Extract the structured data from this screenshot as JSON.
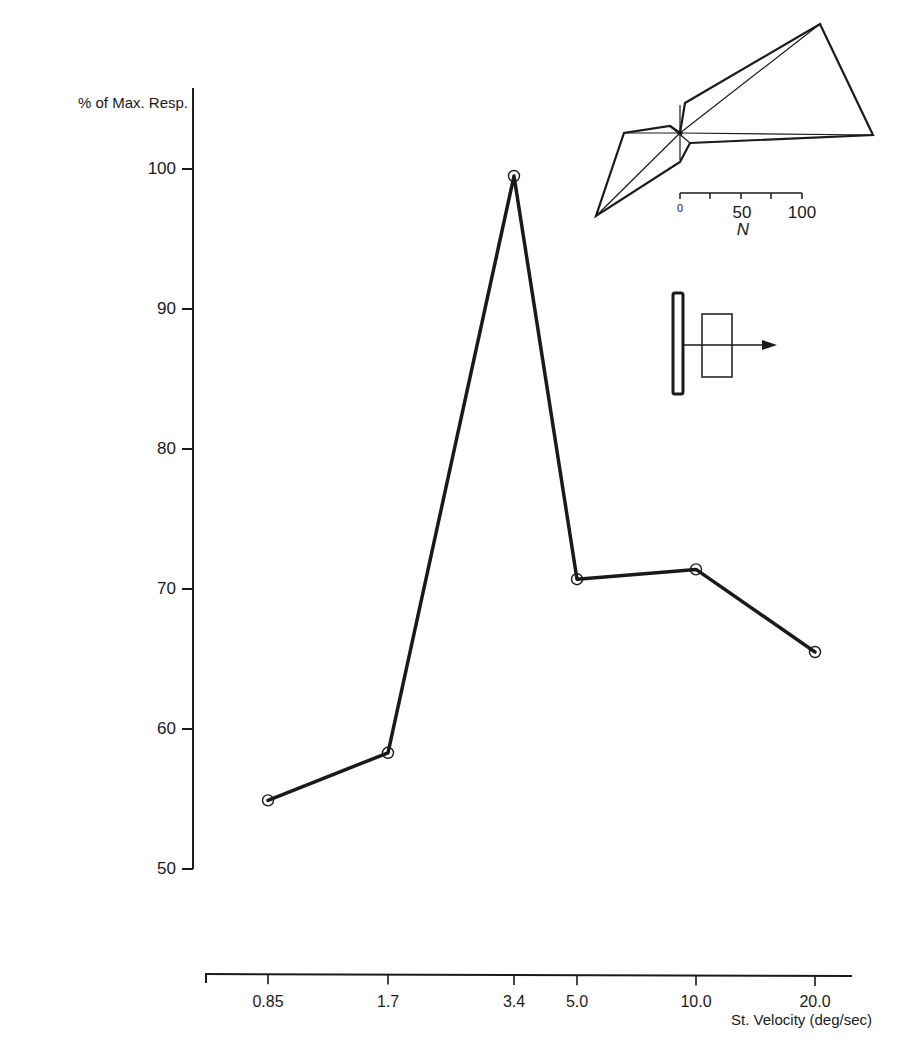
{
  "chart_data": {
    "type": "line",
    "title": "",
    "ylabel": "% of Max. Resp.",
    "xlabel": "St. Velocity (deg/sec)",
    "ylim": [
      50,
      105
    ],
    "yticks": [
      50,
      60,
      70,
      80,
      90,
      100
    ],
    "ytick_labels": [
      "50",
      "60",
      "70",
      "80",
      "90",
      "100"
    ],
    "x_scale": "log",
    "categories": [
      "0.85",
      "1.7",
      "3.4",
      "5.0",
      "10.0",
      "20.0"
    ],
    "x": [
      0.85,
      1.7,
      3.4,
      5.0,
      10.0,
      20.0
    ],
    "series": [
      {
        "name": "Response",
        "marker": "open-circle",
        "values": [
          54.9,
          58.3,
          99.5,
          70.7,
          71.4,
          65.5
        ]
      }
    ],
    "grid": false,
    "legend": null,
    "insets": {
      "polar_plot": {
        "description": "Polar directional tuning plot (star-shaped polygon)",
        "scale_ticks": [
          "0",
          "50",
          "100"
        ],
        "scale_label": "N"
      },
      "stimulus_icon": {
        "description": "Vertical bar with rectangle and rightward arrow indicating stimulus motion direction"
      }
    }
  },
  "axes": {
    "y_title": "% of Max. Resp.",
    "x_title": "St. Velocity (deg/sec)",
    "y_ticks": [
      {
        "label": "100",
        "y": 169
      },
      {
        "label": "90",
        "y": 309
      },
      {
        "label": "80",
        "y": 449
      },
      {
        "label": "70",
        "y": 589
      },
      {
        "label": "60",
        "y": 729
      },
      {
        "label": "50",
        "y": 869
      }
    ],
    "x_ticks": [
      {
        "label": "0.85",
        "x": 268
      },
      {
        "label": "1.7",
        "x": 388
      },
      {
        "label": "3.4",
        "x": 514
      },
      {
        "label": "5.0",
        "x": 577
      },
      {
        "label": "10.0",
        "x": 696
      },
      {
        "label": "20.0",
        "x": 815
      }
    ]
  },
  "inset": {
    "scale_zero": "0",
    "scale_fifty": "50",
    "scale_hundred": "100",
    "scale_unit": "N"
  },
  "colors": {
    "ink": "#1a1a1a",
    "background": "#ffffff"
  }
}
